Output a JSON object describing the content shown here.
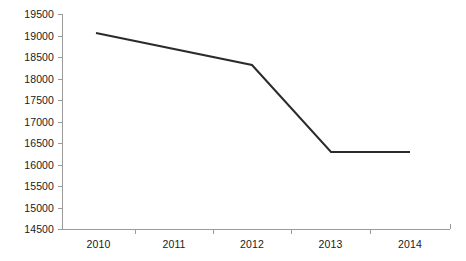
{
  "chart_data": {
    "type": "line",
    "title": "",
    "subtitle": "",
    "xlabel": "",
    "ylabel": "",
    "categories": [
      "2010",
      "2011",
      "2012",
      "2013",
      "2014"
    ],
    "series": [
      {
        "name": "",
        "values": [
          19060,
          18715,
          18370,
          16330,
          16330
        ]
      }
    ],
    "data_points": [
      {
        "x": "2010",
        "y": 19060
      },
      {
        "x": "2012",
        "y": 18370
      },
      {
        "x": "2013",
        "y": 16330
      },
      {
        "x": "2014",
        "y": 16330
      }
    ],
    "ylim": [
      14500,
      19500
    ],
    "ytick_values": [
      19500,
      19000,
      18500,
      18000,
      17500,
      17000,
      16500,
      16000,
      15500,
      15000,
      14500
    ],
    "ytick_labels": [
      "19500",
      "19000",
      "18500",
      "18000",
      "17500",
      "17000",
      "16500",
      "16000",
      "15500",
      "15000",
      "14500"
    ],
    "xtick_labels": [
      "2010",
      "2011",
      "2012",
      "2013",
      "2014"
    ],
    "grid": false,
    "legend": false,
    "legend_position": "none",
    "annotations": [],
    "colors": {
      "series_line": "#2b2b2b",
      "axis": "#9a9a9a",
      "tick": "#9a9a9a",
      "text": "#1a1a1a",
      "background": "#ffffff"
    },
    "geometry": {
      "axis_x": 62,
      "axis_top_y": 14,
      "axis_bottom_y": 229,
      "axis_right_x": 450,
      "category_boundaries": [
        62,
        135,
        213,
        291,
        370,
        450
      ],
      "line_points": [
        [
          96,
          33
        ],
        [
          252,
          65
        ],
        [
          331,
          152
        ],
        [
          410,
          152
        ]
      ],
      "line_width": 2
    }
  }
}
